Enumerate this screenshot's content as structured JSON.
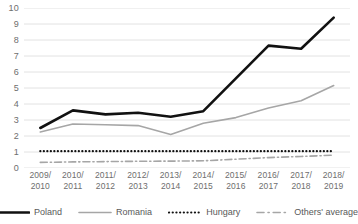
{
  "chart_data": {
    "type": "line",
    "title": "",
    "subtitle": "",
    "xlabel": "",
    "ylabel": "",
    "ylim": [
      0,
      10
    ],
    "yticks": [
      0,
      1,
      2,
      3,
      4,
      5,
      6,
      7,
      8,
      9,
      10
    ],
    "grid": true,
    "legend_position": "bottom",
    "categories": [
      "2009/\n2010",
      "2010/\n2011",
      "2011/\n2012",
      "2012/\n2013",
      "2013/\n2014",
      "2014/\n2015",
      "2015/\n2016",
      "2016/\n2017",
      "2017/\n2018",
      "2018/\n2019"
    ],
    "series": [
      {
        "name": "Poland",
        "color": "#111111",
        "style": "solid",
        "width": 2.6,
        "values": [
          2.5,
          3.6,
          3.35,
          3.45,
          3.2,
          3.55,
          5.6,
          7.65,
          7.45,
          9.4
        ]
      },
      {
        "name": "Romania",
        "color": "#a6a6a6",
        "style": "solid",
        "width": 1.6,
        "values": [
          2.25,
          2.75,
          2.7,
          2.65,
          2.1,
          2.8,
          3.15,
          3.75,
          4.2,
          5.15
        ]
      },
      {
        "name": "Hungary",
        "color": "#111111",
        "style": "dotted",
        "width": 2.2,
        "values": [
          1.05,
          1.05,
          1.05,
          1.05,
          1.05,
          1.05,
          1.05,
          1.05,
          1.05,
          1.05
        ]
      },
      {
        "name": "Others' average",
        "color": "#a6a6a6",
        "style": "dashdot",
        "width": 1.6,
        "values": [
          0.35,
          0.38,
          0.4,
          0.42,
          0.43,
          0.45,
          0.55,
          0.65,
          0.72,
          0.8
        ]
      }
    ]
  },
  "axis": {
    "y_labels": [
      "10",
      "9",
      "8",
      "7",
      "6",
      "5",
      "4",
      "3",
      "2",
      "1",
      "0"
    ],
    "x_labels": [
      {
        "top": "2009/",
        "bottom": "2010"
      },
      {
        "top": "2010/",
        "bottom": "2011"
      },
      {
        "top": "2011/",
        "bottom": "2012"
      },
      {
        "top": "2012/",
        "bottom": "2013"
      },
      {
        "top": "2013/",
        "bottom": "2014"
      },
      {
        "top": "2014/",
        "bottom": "2015"
      },
      {
        "top": "2015/",
        "bottom": "2016"
      },
      {
        "top": "2016/",
        "bottom": "2017"
      },
      {
        "top": "2017/",
        "bottom": "2018"
      },
      {
        "top": "2018/",
        "bottom": "2019"
      }
    ]
  },
  "legend": {
    "items": [
      {
        "label": "Poland",
        "icon": "line-solid-thick-icon"
      },
      {
        "label": "Romania",
        "icon": "line-solid-gray-icon"
      },
      {
        "label": "Hungary",
        "icon": "line-dotted-icon"
      },
      {
        "label": "Others' average",
        "icon": "line-dashdot-icon"
      }
    ]
  },
  "colors": {
    "poland": "#111111",
    "romania": "#a6a6a6",
    "hungary": "#111111",
    "others": "#a6a6a6",
    "grid": "#e2e2e2",
    "text": "#6e6e6e",
    "background": "#ffffff"
  }
}
